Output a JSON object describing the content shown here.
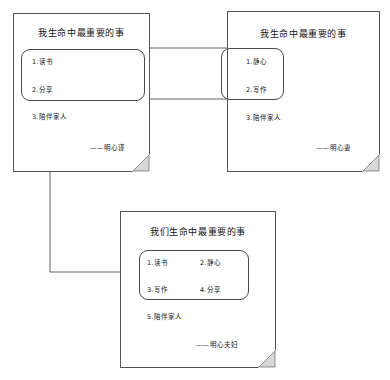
{
  "diagram": {
    "type": "flow-diagram",
    "background_color": "#ffffff",
    "ink_color": "#141414",
    "border_color": "#555555",
    "notes": [
      {
        "id": "note-left",
        "title": "我生命中最重要的事",
        "boxed_items": [
          "1.读书",
          "2.分享"
        ],
        "outside_items": [
          "3.陪伴家人"
        ],
        "signature": "——明心谨"
      },
      {
        "id": "note-right",
        "title": "我生命中最重要的事",
        "boxed_items": [
          "1.静心",
          "2.写作"
        ],
        "outside_items": [
          "3.陪伴家人"
        ],
        "signature": "——明心妻"
      },
      {
        "id": "note-bottom",
        "title": "我们生命中最重要的事",
        "boxed_items": [
          "1.读书",
          "2.静心",
          "3.写作",
          "4.分享"
        ],
        "outside_items": [
          "5.陪伴家人"
        ],
        "signature": "——明心夫妇"
      }
    ],
    "connectors": [
      {
        "id": "connector-right-to-left",
        "from": "note-right-items-box",
        "to": "note-left-items-box",
        "arrow": false
      },
      {
        "id": "connector-merge-to-bottom",
        "from": "note-left-items-box",
        "to": "note-bottom-items-box",
        "arrow": true
      }
    ]
  }
}
